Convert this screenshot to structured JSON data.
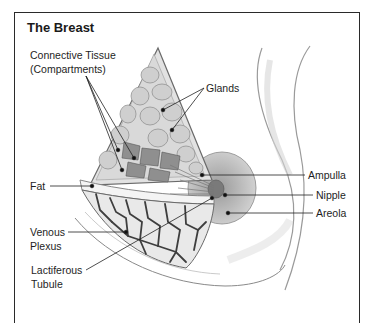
{
  "title": "The Breast",
  "labels": {
    "connective_tissue_line1": "Connective Tissue",
    "connective_tissue_line2": "(Compartments)",
    "glands": "Glands",
    "fat": "Fat",
    "venous_line1": "Venous",
    "venous_line2": "Plexus",
    "lactiferous_line1": "Lactiferous",
    "lactiferous_line2": "Tubule",
    "ampulla": "Ampulla",
    "nipple": "Nipple",
    "areola": "Areola"
  },
  "colors": {
    "frame": "#2a2a2a",
    "tissue_fill": "#e4e4e4",
    "gland_stroke": "#8a8a8a",
    "vein": "#4a4a4a",
    "areola": "#bdbdbd"
  }
}
